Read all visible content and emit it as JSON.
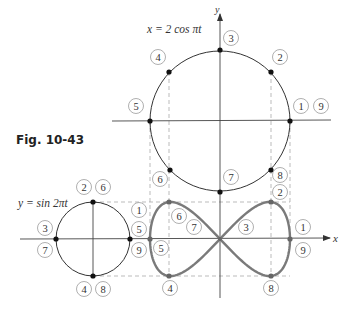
{
  "figure": {
    "caption": "Fig. 10-43",
    "top_equation": "x = 2 cos πt",
    "left_equation": "y = sin 2πt",
    "axis_labels": {
      "x": "x",
      "y": "y"
    },
    "colors": {
      "line": "#333333",
      "curve": "#7a7a7a",
      "dash": "#aaaaaa",
      "badge": "#9a9a9a"
    }
  },
  "big_circle": {
    "center": [
      220,
      121
    ],
    "radius": 70,
    "points": [
      {
        "id": "p1",
        "x": 290,
        "y": 121
      },
      {
        "id": "p2",
        "x": 271,
        "y": 72
      },
      {
        "id": "p3",
        "x": 220,
        "y": 50
      },
      {
        "id": "p4",
        "x": 169,
        "y": 72
      },
      {
        "id": "p5",
        "x": 150,
        "y": 121
      },
      {
        "id": "p6",
        "x": 170,
        "y": 170
      },
      {
        "id": "p7",
        "x": 220,
        "y": 192
      },
      {
        "id": "p8",
        "x": 271,
        "y": 170
      }
    ],
    "labels": [
      {
        "text": "3",
        "x": 231,
        "y": 38
      },
      {
        "text": "4",
        "x": 158,
        "y": 57
      },
      {
        "text": "2",
        "x": 280,
        "y": 57
      },
      {
        "text": "5",
        "x": 136,
        "y": 106
      },
      {
        "text": "1",
        "x": 301,
        "y": 106
      },
      {
        "text": "9",
        "x": 321,
        "y": 106
      },
      {
        "text": "6",
        "x": 160,
        "y": 179
      },
      {
        "text": "7",
        "x": 231,
        "y": 177
      },
      {
        "text": "8",
        "x": 280,
        "y": 175
      }
    ]
  },
  "small_circle": {
    "center": [
      93,
      239
    ],
    "radius": 37,
    "labels": [
      {
        "text": "2",
        "x": 84,
        "y": 187
      },
      {
        "text": "6",
        "x": 103,
        "y": 187
      },
      {
        "text": "3",
        "x": 45,
        "y": 228
      },
      {
        "text": "7",
        "x": 45,
        "y": 250
      },
      {
        "text": "1",
        "x": 139,
        "y": 210
      },
      {
        "text": "5",
        "x": 139,
        "y": 229
      },
      {
        "text": "9",
        "x": 139,
        "y": 250
      },
      {
        "text": "4",
        "x": 84,
        "y": 289
      },
      {
        "text": "8",
        "x": 103,
        "y": 289
      }
    ]
  },
  "lemniscate": {
    "labels": [
      {
        "text": "2",
        "x": 280,
        "y": 192
      },
      {
        "text": "6",
        "x": 179,
        "y": 216
      },
      {
        "text": "7",
        "x": 194,
        "y": 227
      },
      {
        "text": "3",
        "x": 246,
        "y": 227
      },
      {
        "text": "1",
        "x": 303,
        "y": 227
      },
      {
        "text": "5",
        "x": 161,
        "y": 248
      },
      {
        "text": "9",
        "x": 303,
        "y": 250
      },
      {
        "text": "4",
        "x": 170,
        "y": 288
      },
      {
        "text": "8",
        "x": 271,
        "y": 288
      }
    ]
  }
}
